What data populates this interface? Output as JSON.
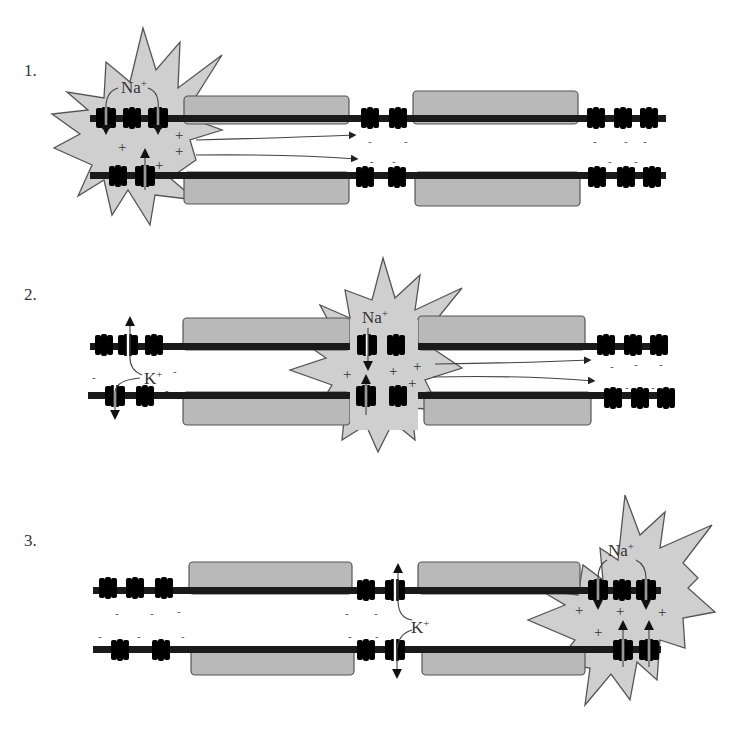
{
  "figure": {
    "colors": {
      "membrane": "#1a1a1a",
      "myelin": "#b9b9b9",
      "depolarization_burst": "#cfcfcf",
      "channel_dark": "#666666",
      "channel_light": "#b5b5b5"
    }
  },
  "panels": [
    {
      "label": "1.",
      "ion_labels": [
        {
          "text": "Na",
          "charge": "+"
        }
      ],
      "charges_inside": [
        "+",
        "+",
        "+",
        "+"
      ],
      "charges_ahead": [
        "-",
        "-",
        "-",
        "-",
        "-",
        "-",
        "-",
        "-",
        "-"
      ]
    },
    {
      "label": "2.",
      "ion_labels": [
        {
          "text": "Na",
          "charge": "+"
        },
        {
          "text": "K",
          "charge": "+"
        }
      ],
      "charges_inside": [
        "+",
        "+",
        "+",
        "+",
        "+"
      ],
      "charges_behind": [
        "-",
        "-",
        "-"
      ],
      "charges_ahead": [
        "-",
        "-",
        "-",
        "-",
        "-",
        "-"
      ]
    },
    {
      "label": "3.",
      "ion_labels": [
        {
          "text": "Na",
          "charge": "+"
        },
        {
          "text": "K",
          "charge": "+"
        }
      ],
      "charges_inside": [
        "+",
        "+",
        "+",
        "+",
        "+"
      ],
      "charges_behind": [
        "-",
        "-",
        "-",
        "-",
        "-",
        "-",
        "-",
        "-",
        "-",
        "-",
        "-"
      ]
    }
  ],
  "labels": {
    "panel1": "1.",
    "panel2": "2.",
    "panel3": "3.",
    "na": "Na",
    "k": "K",
    "plus": "+",
    "minus": "-"
  }
}
